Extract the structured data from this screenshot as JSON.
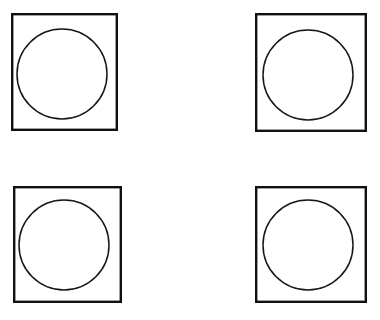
{
  "figure": {
    "background_color": "#ffffff",
    "ink_color": "#000000",
    "canvas": {
      "width": 380,
      "height": 320
    },
    "grid": {
      "rows": 2,
      "columns": 2,
      "count": 4
    },
    "shapes": [
      {
        "id": "cell-top-left",
        "name": "top-left",
        "row": 1,
        "column": 1,
        "square": {
          "x": 11,
          "y": 13,
          "width": 107,
          "height": 118,
          "stroke_width": 2.4,
          "stroke_color": "#101010",
          "fill": "none"
        },
        "circle": {
          "center_x": 62,
          "center_y": 74,
          "radius": 45,
          "stroke_width": 1.5,
          "stroke_color": "#161616",
          "fill": "none"
        }
      },
      {
        "id": "cell-top-right",
        "name": "top-right",
        "row": 1,
        "column": 2,
        "square": {
          "x": 255,
          "y": 13,
          "width": 112,
          "height": 119,
          "stroke_width": 2.4,
          "stroke_color": "#101010",
          "fill": "none"
        },
        "circle": {
          "center_x": 308,
          "center_y": 75,
          "radius": 45,
          "stroke_width": 1.5,
          "stroke_color": "#161616",
          "fill": "none"
        }
      },
      {
        "id": "cell-bottom-left",
        "name": "bottom-left",
        "row": 2,
        "column": 1,
        "square": {
          "x": 13,
          "y": 186,
          "width": 109,
          "height": 117,
          "stroke_width": 2.4,
          "stroke_color": "#101010",
          "fill": "none"
        },
        "circle": {
          "center_x": 64,
          "center_y": 245,
          "radius": 45,
          "stroke_width": 1.5,
          "stroke_color": "#161616",
          "fill": "none"
        }
      },
      {
        "id": "cell-bottom-right",
        "name": "bottom-right",
        "row": 2,
        "column": 2,
        "square": {
          "x": 255,
          "y": 186,
          "width": 112,
          "height": 117,
          "stroke_width": 2.4,
          "stroke_color": "#101010",
          "fill": "none"
        },
        "circle": {
          "center_x": 308,
          "center_y": 245,
          "radius": 45,
          "stroke_width": 1.5,
          "stroke_color": "#161616",
          "fill": "none"
        }
      }
    ]
  }
}
